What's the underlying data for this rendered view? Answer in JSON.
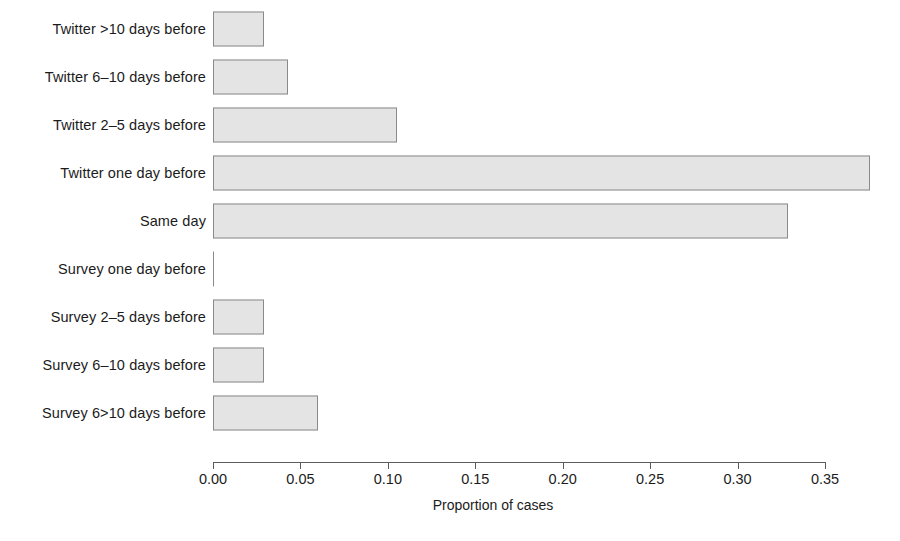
{
  "chart_data": {
    "type": "bar",
    "orientation": "horizontal",
    "title": "",
    "subtitle": "",
    "xlabel": "Proportion of cases",
    "ylabel": "",
    "xlim": [
      0.0,
      0.35
    ],
    "ylim": null,
    "grid": false,
    "legend": null,
    "xticks": [
      "0.00",
      "0.05",
      "0.10",
      "0.15",
      "0.20",
      "0.25",
      "0.30",
      "0.35"
    ],
    "xtick_values": [
      0.0,
      0.05,
      0.1,
      0.15,
      0.2,
      0.25,
      0.3,
      0.35
    ],
    "categories": [
      "Twitter >10 days before",
      "Twitter 6-10 days before",
      "Twitter 2-5 days before",
      "Twitter one day before",
      "Same day",
      "Survey one day before",
      "Survey 2-5 days before",
      "Survey 6-10 days before",
      "Survey 6>10 days before"
    ],
    "values": [
      0.029,
      0.043,
      0.105,
      0.376,
      0.329,
      0.0,
      0.029,
      0.029,
      0.06
    ],
    "bar_fill_color": "#e4e4e4",
    "bar_border_color": "#8a8a8a",
    "axis_color": "#5c5c5c",
    "background_color": "#ffffff"
  },
  "labels": {
    "cat_0": "Twitter >10 days before",
    "cat_1": "Twitter 6–10 days before",
    "cat_2": "Twitter 2–5 days before",
    "cat_3": "Twitter one day before",
    "cat_4": "Same day",
    "cat_5": "Survey one day before",
    "cat_6": "Survey 2–5 days before",
    "cat_7": "Survey 6–10 days before",
    "cat_8": "Survey 6>10 days before"
  },
  "ticks": {
    "t0": "0.00",
    "t1": "0.05",
    "t2": "0.10",
    "t3": "0.15",
    "t4": "0.20",
    "t5": "0.25",
    "t6": "0.30",
    "t7": "0.35"
  },
  "axis": {
    "x_title": "Proportion of cases"
  }
}
